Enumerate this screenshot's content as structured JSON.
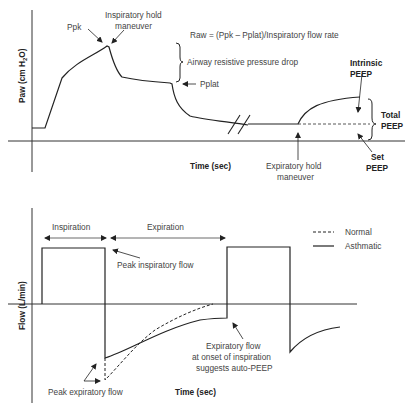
{
  "top_panel": {
    "y_axis_label": "Paw (cm H2O)",
    "y_axis_label_main": "Paw (cm H",
    "y_axis_label_sub": "2",
    "y_axis_label_end": "O)",
    "x_axis_label": "Time (sec)",
    "annotations": {
      "ppk": "Ppk",
      "insp_hold_line1": "Inspiratory hold",
      "insp_hold_line2": "maneuver",
      "raw_formula": "Raw = (Ppk – Pplat)/Inspiratory flow rate",
      "airway_drop": "Airway resistive pressure drop",
      "pplat": "Pplat",
      "intrinsic_line1": "Intrinsic",
      "intrinsic_line2": "PEEP",
      "total_line1": "Total",
      "total_line2": "PEEP",
      "set_line1": "Set",
      "set_line2": "PEEP",
      "exp_hold_line1": "Expiratory hold",
      "exp_hold_line2": "maneuver"
    }
  },
  "bottom_panel": {
    "y_axis_label": "Flow (L/min)",
    "x_axis_label": "Time (sec)",
    "annotations": {
      "inspiration": "Inspiration",
      "expiration": "Expiration",
      "peak_insp_flow": "Peak inspiratory flow",
      "peak_exp_flow": "Peak expiratory flow",
      "exp_flow_line1": "Expiratory flow",
      "exp_flow_line2": "at onset of inspiration",
      "exp_flow_line3": "suggests auto-PEEP"
    },
    "legend": [
      {
        "label": "Normal",
        "style": "dashed"
      },
      {
        "label": "Asthmatic",
        "style": "solid"
      }
    ]
  },
  "colors": {
    "line": "#222222",
    "text": "#444444",
    "axis": "#333333"
  }
}
